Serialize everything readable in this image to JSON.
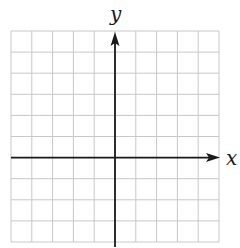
{
  "diagram": {
    "type": "coordinate-grid",
    "x_label": "x",
    "y_label": "y",
    "grid": {
      "columns": 10,
      "rows": 10,
      "left": 11,
      "top": 31,
      "cell_w": 20.8,
      "cell_h": 21.1,
      "line_color": "#c8c8c8"
    },
    "origin": {
      "col": 5,
      "row": 6
    },
    "axis_color": "#1a1a1a"
  }
}
